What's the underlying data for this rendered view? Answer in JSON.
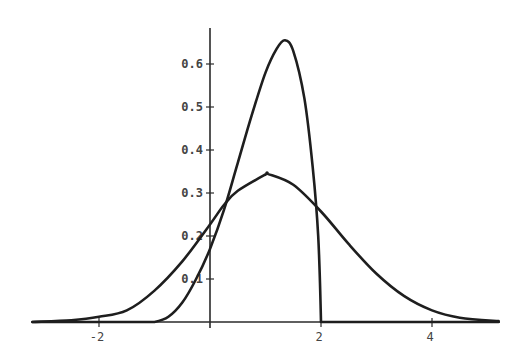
{
  "chart_data": {
    "type": "line",
    "title": "",
    "xlabel": "",
    "ylabel": "",
    "xlim": [
      -3.2,
      5.2
    ],
    "ylim": [
      0,
      0.68
    ],
    "grid": false,
    "legend": null,
    "x_ticks": [
      {
        "value": -2,
        "label": "-2"
      },
      {
        "value": 2,
        "label": "2"
      },
      {
        "value": 4,
        "label": "4"
      }
    ],
    "y_ticks": [
      {
        "value": 0.1,
        "label": "0.1"
      },
      {
        "value": 0.2,
        "label": "0.2"
      },
      {
        "value": 0.3,
        "label": "0.3"
      },
      {
        "value": 0.4,
        "label": "0.4"
      },
      {
        "value": 0.5,
        "label": "0.5"
      },
      {
        "value": 0.6,
        "label": "0.6"
      }
    ],
    "series": [
      {
        "name": "bell-curve",
        "description": "symmetric bell-shaped density, peak ~0.344 at x~1.05",
        "x": [
          -3.2,
          -2.5,
          -2,
          -1.5,
          -1,
          -0.5,
          0,
          0.25,
          0.5,
          1,
          1.05,
          1.5,
          2,
          2.5,
          3,
          3.5,
          4,
          4.5,
          5.2
        ],
        "y": [
          0.0,
          0.004,
          0.012,
          0.027,
          0.073,
          0.141,
          0.227,
          0.272,
          0.305,
          0.343,
          0.344,
          0.319,
          0.257,
          0.181,
          0.112,
          0.06,
          0.027,
          0.01,
          0.002
        ]
      },
      {
        "name": "tall-skewed-curve",
        "description": "left-skewed density supported on [-1, 2], peak ~0.655 at x~1.35, drops sharply to 0 at x=2",
        "x": [
          -3.2,
          -1.0,
          -0.75,
          -0.5,
          -0.25,
          0,
          0.25,
          0.5,
          0.75,
          1.0,
          1.2,
          1.35,
          1.5,
          1.7,
          1.85,
          1.95,
          2.0,
          5.2
        ],
        "y": [
          0.0,
          0.0,
          0.012,
          0.045,
          0.1,
          0.17,
          0.26,
          0.37,
          0.48,
          0.58,
          0.635,
          0.655,
          0.63,
          0.52,
          0.36,
          0.2,
          0.0,
          0.0
        ]
      }
    ]
  }
}
